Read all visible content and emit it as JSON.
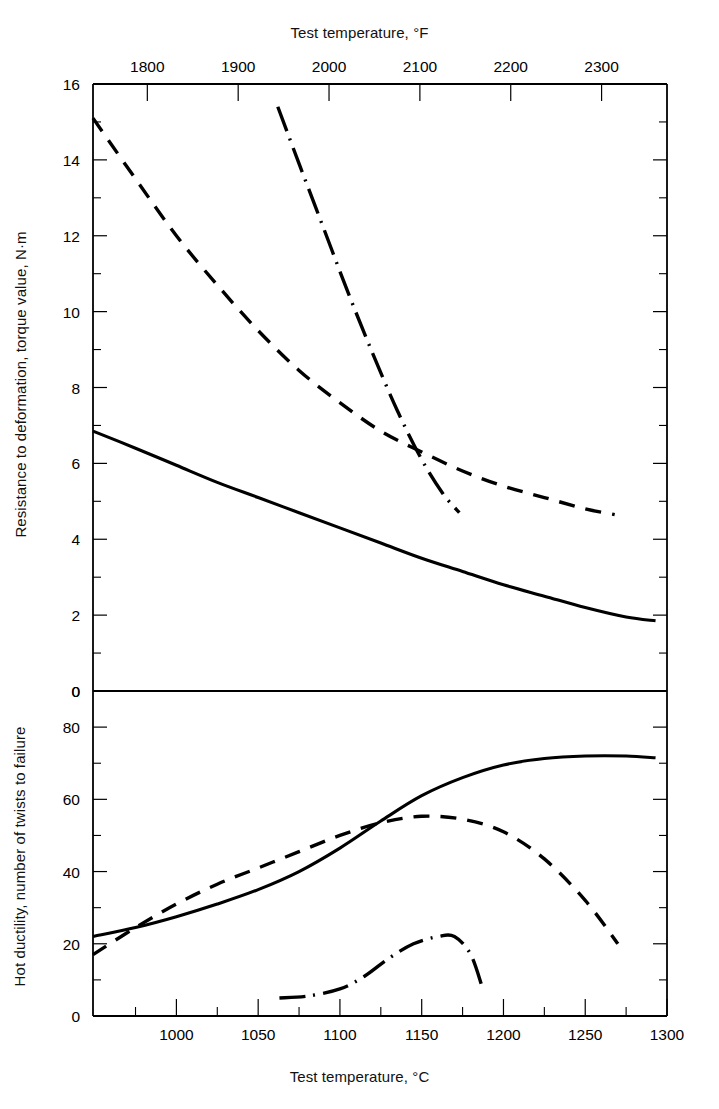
{
  "chart_data": {
    "type": "line",
    "title": "",
    "panels": [
      {
        "id": "upper",
        "ylabel": "Resistance to deformation, torque value, N·m",
        "ylim": [
          0,
          16
        ],
        "yticks": [
          0,
          2,
          4,
          6,
          8,
          10,
          12,
          14,
          16
        ],
        "yticklabels": [
          "0",
          "2",
          "4",
          "6",
          "8",
          "10",
          "12",
          "14",
          "16"
        ],
        "yminor_step": 1,
        "series": [
          {
            "name": "solid-curve-upper",
            "style": "solid",
            "x": [
              949,
              975,
              1000,
              1025,
              1050,
              1075,
              1100,
              1125,
              1150,
              1175,
              1200,
              1225,
              1250,
              1275,
              1293
            ],
            "y": [
              6.85,
              6.4,
              5.95,
              5.5,
              5.1,
              4.7,
              4.3,
              3.9,
              3.5,
              3.15,
              2.8,
              2.5,
              2.2,
              1.95,
              1.85
            ]
          },
          {
            "name": "dashed-curve-upper",
            "style": "dashed",
            "x": [
              949,
              975,
              1000,
              1025,
              1050,
              1075,
              1100,
              1125,
              1150,
              1175,
              1200,
              1225,
              1250,
              1268
            ],
            "y": [
              15.1,
              13.5,
              12.0,
              10.7,
              9.5,
              8.45,
              7.6,
              6.85,
              6.3,
              5.8,
              5.4,
              5.1,
              4.8,
              4.65
            ]
          },
          {
            "name": "dash-dot-curve-upper",
            "style": "dashdot",
            "x": [
              1062,
              1075,
              1090,
              1105,
              1120,
              1135,
              1150,
              1163,
              1173
            ],
            "y": [
              15.4,
              13.9,
              12.2,
              10.5,
              8.9,
              7.4,
              6.1,
              5.2,
              4.7
            ]
          }
        ]
      },
      {
        "id": "lower",
        "ylabel": "Hot ductility, number of twists to failure",
        "ylim": [
          0,
          90
        ],
        "yticks": [
          0,
          20,
          40,
          60,
          80
        ],
        "yticklabels": [
          "0",
          "20",
          "40",
          "60",
          "80"
        ],
        "yminor_step": 10,
        "top_label": "0",
        "series": [
          {
            "name": "solid-curve-lower",
            "style": "solid",
            "x": [
              949,
              975,
              1000,
              1025,
              1050,
              1075,
              1100,
              1125,
              1150,
              1175,
              1200,
              1225,
              1250,
              1275,
              1293
            ],
            "y": [
              22.0,
              24.5,
              27.5,
              31.0,
              35.0,
              40.0,
              46.5,
              54.0,
              61.0,
              66.0,
              69.5,
              71.3,
              72.0,
              72.0,
              71.5
            ]
          },
          {
            "name": "dashed-curve-lower",
            "style": "dashed",
            "x": [
              949,
              975,
              1000,
              1025,
              1050,
              1075,
              1100,
              1125,
              1150,
              1175,
              1200,
              1225,
              1250,
              1270
            ],
            "y": [
              17.0,
              24.5,
              31.0,
              36.5,
              41.0,
              45.5,
              50.0,
              53.5,
              55.3,
              54.5,
              51.0,
              43.5,
              32.0,
              20.0
            ]
          },
          {
            "name": "dash-dot-curve-lower",
            "style": "dashdot",
            "x": [
              1063,
              1080,
              1100,
              1115,
              1130,
              1145,
              1160,
              1170,
              1180,
              1187
            ],
            "y": [
              5.0,
              5.5,
              7.5,
              11.0,
              16.0,
              20.0,
              22.0,
              22.0,
              17.0,
              8.0
            ]
          }
        ]
      }
    ],
    "x_bottom": {
      "label": "Test temperature, °C",
      "unit": "°C",
      "lim": [
        949,
        1300
      ],
      "ticks": [
        1000,
        1050,
        1100,
        1150,
        1200,
        1250,
        1300
      ],
      "ticklabels": [
        "1000",
        "1050",
        "1100",
        "1150",
        "1200",
        "1250",
        "1300"
      ],
      "minor_step": 25
    },
    "x_top": {
      "label": "Test temperature, °F",
      "unit": "°F",
      "ticks": [
        1800,
        1900,
        2000,
        2100,
        2200,
        2300
      ],
      "ticklabels": [
        "1800",
        "1900",
        "2000",
        "2100",
        "2200",
        "2300"
      ]
    },
    "grid": false,
    "legend": "none",
    "line_color": "#000000"
  },
  "axes": {
    "top_title": "Test temperature, °F",
    "bottom_title": "Test temperature, °C",
    "left_title_upper": "Resistance to deformation, torque value, N·m",
    "left_title_lower": "Hot ductility, number of twists to failure"
  }
}
